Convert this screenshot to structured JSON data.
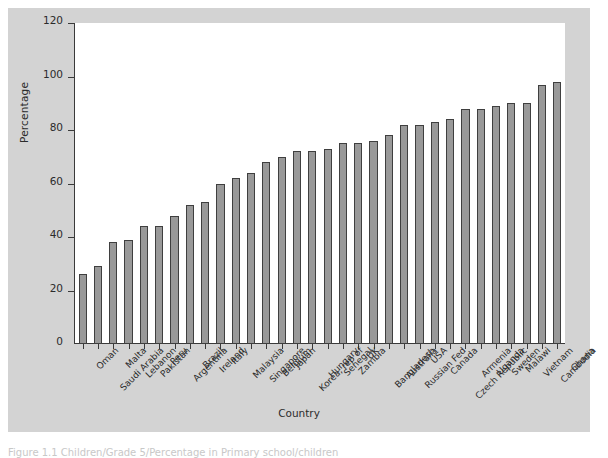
{
  "chart_data": {
    "type": "bar",
    "title": "",
    "xlabel": "Country",
    "ylabel": "Percentage",
    "ylim": [
      0,
      120
    ],
    "ytick_labels": [
      "0",
      "20",
      "40",
      "60",
      "80",
      "100",
      "120"
    ],
    "ytick_values": [
      0,
      20,
      40,
      60,
      80,
      100,
      120
    ],
    "grid": false,
    "legend": "none",
    "bar_fill_color": "#999999",
    "bar_edge_color": "#3f3f3f",
    "plot_background_color": "#ffffff",
    "figure_background_color": "#d3d3d3",
    "categories": [
      "Oman",
      "Saudi Arabia",
      "Malta",
      "Lebanon",
      "Pakistan",
      "Peru",
      "Argentina",
      "Brazil",
      "Ireland",
      "Italy",
      "Malaysia",
      "Singapore",
      "Belgium",
      "Japan",
      "Korea, rep of",
      "Hungary",
      "Senegal",
      "Zambia",
      "UK",
      "Bangladesh",
      "Australia",
      "Russian Fed",
      "USA",
      "Canada",
      "Czech Republic",
      "Armenia",
      "Uganda",
      "Sweden",
      "Malawi",
      "Vietnam",
      "Cambodia",
      "Ghana"
    ],
    "values": [
      26,
      29,
      38,
      39,
      44,
      44,
      48,
      52,
      53,
      60,
      62,
      64,
      68,
      70,
      72,
      72,
      73,
      75,
      75,
      76,
      78,
      82,
      82,
      83,
      84,
      88,
      88,
      89,
      90,
      90,
      97,
      98
    ]
  },
  "caption": {
    "text_fragment": "Figure 1.1 Children/Grade 5/Percentage in Primary school/children"
  }
}
